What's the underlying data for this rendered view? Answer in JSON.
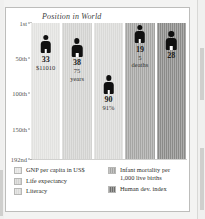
{
  "chart_data": {
    "type": "bar",
    "title": "Position in World",
    "xlabel": "",
    "ylabel": "Position in World",
    "ylim": [
      1,
      192
    ],
    "y_inverted": true,
    "grid": true,
    "ticks": [
      "1st",
      "50th",
      "100th",
      "150th",
      "192nd"
    ],
    "tick_values": [
      1,
      50,
      100,
      150,
      192
    ],
    "legend_position": "bottom",
    "categories": [
      "GNP per capita in US$",
      "Life expectancy",
      "Literacy",
      "Infant mortality per 1,000 live births",
      "Human dev. index"
    ],
    "values": [
      33,
      38,
      90,
      19,
      28
    ],
    "series": [
      {
        "name": "GNP per capita in US$",
        "rank": "33",
        "value_label": "$11010",
        "value_label_2": "",
        "rank_value": 33,
        "color": "#e2e2e0"
      },
      {
        "name": "Life expectancy",
        "rank": "38",
        "value_label": "75",
        "value_label_2": "years",
        "rank_value": 38,
        "color": "#d2d2d0"
      },
      {
        "name": "Literacy",
        "rank": "90",
        "value_label": "91%",
        "value_label_2": "",
        "rank_value": 90,
        "color": "#dadad8"
      },
      {
        "name": "Infant mortality per 1,000 live births",
        "rank": "19",
        "value_label": "5",
        "value_label_2": "deaths",
        "rank_value": 19,
        "color": "#a5a5a3"
      },
      {
        "name": "Human dev. index",
        "rank": "28",
        "value_label": "",
        "value_label_2": "",
        "rank_value": 28,
        "color": "#8a8a88"
      }
    ]
  },
  "axis": {
    "tick_1": "1st",
    "tick_2": "50th",
    "tick_3": "100th",
    "tick_4": "150th",
    "tick_5": "192nd"
  },
  "legend": {
    "left": [
      {
        "label": "GNP per capita in US$",
        "color": "#e2e2e0"
      },
      {
        "label": "Life expectancy",
        "color": "#d2d2d0"
      },
      {
        "label": "Literacy",
        "color": "#dadad8"
      }
    ],
    "right": [
      {
        "label": "Infant mortality per\n1,000 live births",
        "color": "#a5a5a3"
      },
      {
        "label": "Human dev. index",
        "color": "#6f6f6d"
      }
    ]
  }
}
